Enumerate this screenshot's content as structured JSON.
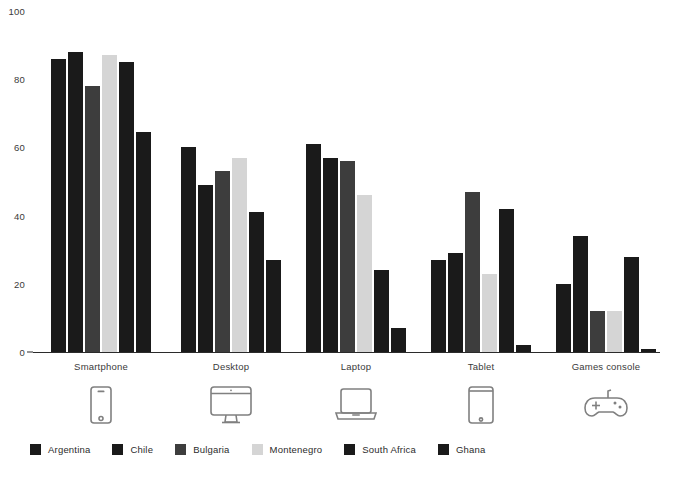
{
  "chart_data": {
    "type": "bar",
    "title": "",
    "subtitle": "",
    "xlabel": "",
    "ylabel": "",
    "ylim": [
      0,
      100
    ],
    "yticks": [
      0,
      20,
      40,
      60,
      80,
      100
    ],
    "grid": false,
    "legend_position": "bottom-left",
    "categories": [
      "Smartphone",
      "Desktop",
      "Laptop",
      "Tablet",
      "Games console"
    ],
    "category_icons": [
      "smartphone-icon",
      "desktop-icon",
      "laptop-icon",
      "tablet-icon",
      "games-console-icon"
    ],
    "series": [
      {
        "name": "Argentina",
        "color": "#1a1a1a",
        "values": [
          86,
          60,
          61,
          27,
          20
        ]
      },
      {
        "name": "Chile",
        "color": "#1a1a1a",
        "values": [
          88,
          49,
          57,
          29,
          34
        ]
      },
      {
        "name": "Bulgaria",
        "color": "#3d3d3d",
        "values": [
          78,
          53,
          56,
          47,
          12
        ]
      },
      {
        "name": "Montenegro",
        "color": "#d5d5d5",
        "values": [
          87,
          57,
          46,
          23,
          12
        ]
      },
      {
        "name": "South Africa",
        "color": "#1a1a1a",
        "values": [
          85,
          41,
          24,
          42,
          28
        ]
      },
      {
        "name": "Ghana",
        "color": "#1a1a1a",
        "values": [
          64.5,
          27,
          7,
          2,
          1
        ]
      }
    ]
  },
  "axis": {
    "tick_labels": [
      "0",
      "20",
      "40",
      "60",
      "80",
      "100"
    ]
  }
}
